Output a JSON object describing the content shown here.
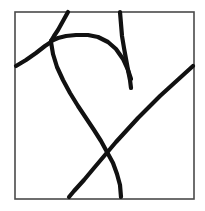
{
  "figure": {
    "background_color": "#ffffff",
    "ink_color": "#111111",
    "frame_color": "#4a4a4a",
    "stroke_width": 4.2,
    "canvas": {
      "width": 205,
      "height": 211
    },
    "frame": {
      "x": 15,
      "y": 12,
      "width": 179,
      "height": 187
    },
    "strokes": [
      {
        "name": "top-entry-stroke",
        "label": "stroke descending from top border to central junction",
        "path": "M 68 12 L 63 21 L 58 30 L 54 36 L 51 41"
      },
      {
        "name": "left-entry-stroke",
        "label": "short stroke from left border up to central junction",
        "path": "M 16 66 L 26 60 L 36 53 L 45 46 L 51 42"
      },
      {
        "name": "upper-arc-stroke",
        "label": "arc curving right from junction then bending down to meet vertical stroke",
        "path": "M 51 41 L 58 38 L 66 36 L 76 35 L 88 35 L 98 37 L 108 42 L 116 49 L 123 59 L 128 70 L 131 79"
      },
      {
        "name": "vertical-stroke",
        "label": "near-vertical stroke from top border down past the arc",
        "path": "M 120 12 L 121 24 L 122 36 L 124 48 L 126 59 L 128 70 L 130 80 L 131 88"
      },
      {
        "name": "long-descending-curve",
        "label": "long curve from junction sweeping down and right to the bottom border",
        "path": "M 51 42 L 53 54 L 57 67 L 63 80 L 70 93 L 78 106 L 86 118 L 94 130 L 101 141 L 107 152 L 113 163 L 117 174 L 120 185 L 121 197"
      },
      {
        "name": "diagonal-stroke",
        "label": "diagonal from right border down-left to the bottom border, crossing the long curve",
        "path": "M 193 66 L 182 76 L 171 86 L 160 96 L 149 107 L 138 118 L 127 130 L 116 142 L 105 155 L 94 168 L 84 180 L 74 191 L 69 197"
      }
    ],
    "junctions": [
      {
        "name": "upper-left-junction",
        "x": 51,
        "y": 42
      },
      {
        "name": "arc-vertical-meeting",
        "x": 130,
        "y": 79
      },
      {
        "name": "lower-x-crossing",
        "x": 104,
        "y": 166
      }
    ]
  }
}
